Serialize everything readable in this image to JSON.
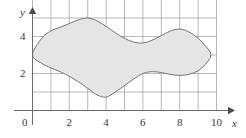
{
  "figure": {
    "width": 246,
    "height": 138,
    "background": "#ffffff"
  },
  "axes": {
    "x_axis_label": "x",
    "y_axis_label": "y",
    "origin_label": "0",
    "axis_color": "#6b6b6b",
    "grid_color": "#9a9a9a",
    "x_ticks": [
      {
        "value": 2,
        "label": "2"
      },
      {
        "value": 4,
        "label": "4"
      },
      {
        "value": 6,
        "label": "6"
      },
      {
        "value": 8,
        "label": "8"
      },
      {
        "value": 10,
        "label": "10"
      }
    ],
    "y_ticks": [
      {
        "value": 2,
        "label": "2"
      },
      {
        "value": 4,
        "label": "4"
      }
    ]
  },
  "chart_data": {
    "type": "area",
    "title": "",
    "xlabel": "x",
    "ylabel": "y",
    "xlim": [
      0,
      10
    ],
    "ylim": [
      0,
      6
    ],
    "grid": true,
    "legend": null,
    "x_tick_labels": [
      "0",
      "2",
      "4",
      "6",
      "8",
      "10"
    ],
    "x_tick_values": [
      0,
      2,
      4,
      6,
      8,
      10
    ],
    "y_tick_labels": [
      "2",
      "4"
    ],
    "y_tick_values": [
      2,
      4
    ],
    "grid_spacing_x": 1,
    "grid_spacing_y": 1,
    "region": {
      "name": "shaded-region",
      "closed": true,
      "fill_color": "#e5e5e5",
      "stroke_color": "#767676",
      "stroke_width": 1,
      "upper_boundary": [
        {
          "x": 0.0,
          "y": 3.0
        },
        {
          "x": 0.5,
          "y": 3.9
        },
        {
          "x": 1.0,
          "y": 4.3
        },
        {
          "x": 1.5,
          "y": 4.5
        },
        {
          "x": 2.0,
          "y": 4.7
        },
        {
          "x": 2.5,
          "y": 4.9
        },
        {
          "x": 3.0,
          "y": 5.0
        },
        {
          "x": 3.5,
          "y": 4.85
        },
        {
          "x": 4.0,
          "y": 4.55
        },
        {
          "x": 4.5,
          "y": 4.2
        },
        {
          "x": 5.0,
          "y": 3.9
        },
        {
          "x": 5.5,
          "y": 3.7
        },
        {
          "x": 6.0,
          "y": 3.65
        },
        {
          "x": 6.5,
          "y": 3.8
        },
        {
          "x": 7.0,
          "y": 4.05
        },
        {
          "x": 7.5,
          "y": 4.3
        },
        {
          "x": 8.0,
          "y": 4.4
        },
        {
          "x": 8.5,
          "y": 4.25
        },
        {
          "x": 9.0,
          "y": 3.9
        },
        {
          "x": 9.4,
          "y": 3.5
        },
        {
          "x": 9.7,
          "y": 3.0
        }
      ],
      "lower_boundary": [
        {
          "x": 9.7,
          "y": 3.0
        },
        {
          "x": 9.4,
          "y": 2.5
        },
        {
          "x": 9.0,
          "y": 2.15
        },
        {
          "x": 8.5,
          "y": 1.95
        },
        {
          "x": 8.0,
          "y": 1.9
        },
        {
          "x": 7.5,
          "y": 1.95
        },
        {
          "x": 7.0,
          "y": 2.05
        },
        {
          "x": 6.5,
          "y": 2.1
        },
        {
          "x": 6.0,
          "y": 2.0
        },
        {
          "x": 5.5,
          "y": 1.7
        },
        {
          "x": 5.0,
          "y": 1.35
        },
        {
          "x": 4.5,
          "y": 1.0
        },
        {
          "x": 4.0,
          "y": 0.72
        },
        {
          "x": 3.5,
          "y": 0.85
        },
        {
          "x": 3.0,
          "y": 1.2
        },
        {
          "x": 2.5,
          "y": 1.55
        },
        {
          "x": 2.0,
          "y": 1.85
        },
        {
          "x": 1.5,
          "y": 2.1
        },
        {
          "x": 1.0,
          "y": 2.3
        },
        {
          "x": 0.5,
          "y": 2.55
        },
        {
          "x": 0.0,
          "y": 3.0
        }
      ],
      "extremes": {
        "leftmost": {
          "x": 0.0,
          "y": 3.0
        },
        "rightmost": {
          "x": 9.7,
          "y": 3.0
        },
        "highest": {
          "x": 3.0,
          "y": 5.0
        },
        "lowest": {
          "x": 4.0,
          "y": 0.72
        }
      }
    }
  }
}
